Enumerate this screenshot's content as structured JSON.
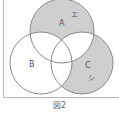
{
  "diagram": {
    "type": "venn-3",
    "sets": [
      {
        "id": "A",
        "label": "A",
        "shaded_exclusive_region": true
      },
      {
        "id": "B",
        "label": "B",
        "shaded_exclusive_region": false
      },
      {
        "id": "C",
        "label": "C",
        "shaded_exclusive_region": true
      }
    ],
    "region_labels": [
      {
        "region": "A-only",
        "label": "エ"
      },
      {
        "region": "C-only",
        "label": "シ"
      }
    ],
    "shade_color": "#cfcfcf",
    "outline_color": "#8a8a8a",
    "caption": "図2"
  }
}
